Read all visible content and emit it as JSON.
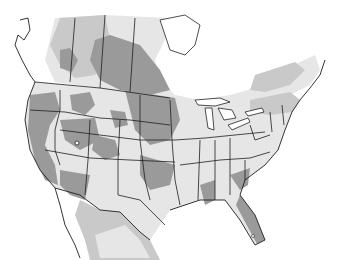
{
  "map": {
    "title_fragment": "",
    "region": "North America (United States, southern Canada, northern Mexico)",
    "shading_levels": [
      {
        "name": "light",
        "color": "#e6e6e6"
      },
      {
        "name": "medium",
        "color": "#c9c9c9"
      },
      {
        "name": "dark",
        "color": "#9a9a9a"
      }
    ],
    "outline_color": "#1e1e1e",
    "background_color": "#ffffff"
  }
}
